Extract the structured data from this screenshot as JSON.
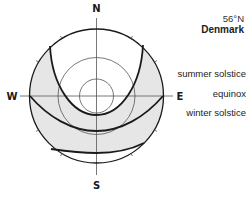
{
  "location": {
    "latitude": "56°N",
    "country": "Denmark"
  },
  "compass": {
    "north": "N",
    "south": "S",
    "east": "E",
    "west": "W"
  },
  "paths": [
    {
      "name": "summer solstice",
      "label": "summer solstice"
    },
    {
      "name": "equinox",
      "label": "equinox"
    },
    {
      "name": "winter solstice",
      "label": "winter solstice"
    }
  ],
  "colors": {
    "stroke": "#1a1a1a",
    "fill_band": "#e6e6e6",
    "thin_line": "#555555"
  }
}
